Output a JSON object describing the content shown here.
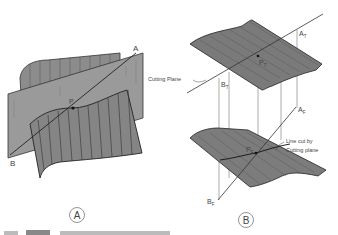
{
  "figure_a": {
    "caption_letter": "A",
    "point_labels": {
      "a": "A",
      "b": "B",
      "p": "P"
    }
  },
  "figure_b": {
    "caption_letter": "B",
    "cutting_plane_label": "Cutting Plane",
    "line_cut_label_1": "Line cut by",
    "line_cut_label_2": "Cutting plane",
    "top_view_labels": {
      "a": "A",
      "a_sub": "T",
      "b": "B",
      "b_sub": "T",
      "p": "P",
      "p_sub": "T"
    },
    "front_view_labels": {
      "a": "A",
      "a_sub": "F",
      "b": "B",
      "b_sub": "F",
      "p": "P",
      "p_sub": "F"
    }
  },
  "colors": {
    "surface": "#8a8a8a",
    "surface_dark": "#6e6e6e",
    "line": "#333333",
    "hatch": "#555555"
  }
}
